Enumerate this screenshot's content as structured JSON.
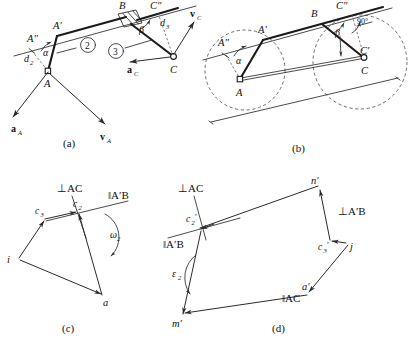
{
  "figure": {
    "panels": [
      {
        "id": "a",
        "caption": "(a)",
        "labels": {
          "A": "A",
          "A_prime": "A′",
          "A_dprime": "A″",
          "B": "B",
          "C": "C",
          "C_dprime": "C″",
          "alpha": "α",
          "beta": "β",
          "d2": "d",
          "d2_sub": "2",
          "d3": "d",
          "d3_sub": "3",
          "link2": "2",
          "link3": "3",
          "vA": "v",
          "vA_sub": "A",
          "vC": "v",
          "vC_sub": "C",
          "aA": "a",
          "aA_sub": "A",
          "aC": "a",
          "aC_sub": "C"
        }
      },
      {
        "id": "b",
        "caption": "(b)",
        "labels": {
          "A": "A",
          "A_prime": "A′",
          "A_dprime": "A″",
          "B": "B",
          "C": "C",
          "C_prime": "C′",
          "C_dprime": "C″",
          "alpha": "α",
          "beta": "β",
          "right_angle": "90°"
        }
      },
      {
        "id": "c",
        "caption": "(c)",
        "labels": {
          "i": "i",
          "a": "a",
          "c2": "c",
          "c2_sub": "2",
          "c3": "c",
          "c3_sub": "3",
          "perp_AC": "⊥AC",
          "par_ApB": "‖A′B",
          "omega2": "ω",
          "omega2_sub": "2"
        }
      },
      {
        "id": "d",
        "caption": "(d)",
        "labels": {
          "j": "j",
          "a_prime": "a′",
          "m_prime": "m′",
          "n_prime": "n′",
          "c2_prime": "c",
          "c2_prime_sub": "2",
          "c2_prime_mark": "′",
          "c3_prime": "c",
          "c3_prime_sub": "3",
          "c3_prime_mark": "′",
          "perp_AC": "⊥AC",
          "perp_ApB": "⊥A′B",
          "par_ApB": "‖A′B",
          "par_AC": "‖AC",
          "epsilon2": "ε",
          "epsilon2_sub": "2"
        }
      }
    ],
    "colors": {
      "ink": "#1a1a1a",
      "thin_ink": "#2a2a2a",
      "dash_ink": "#4a4a4a",
      "paper": "#ffffff"
    }
  }
}
